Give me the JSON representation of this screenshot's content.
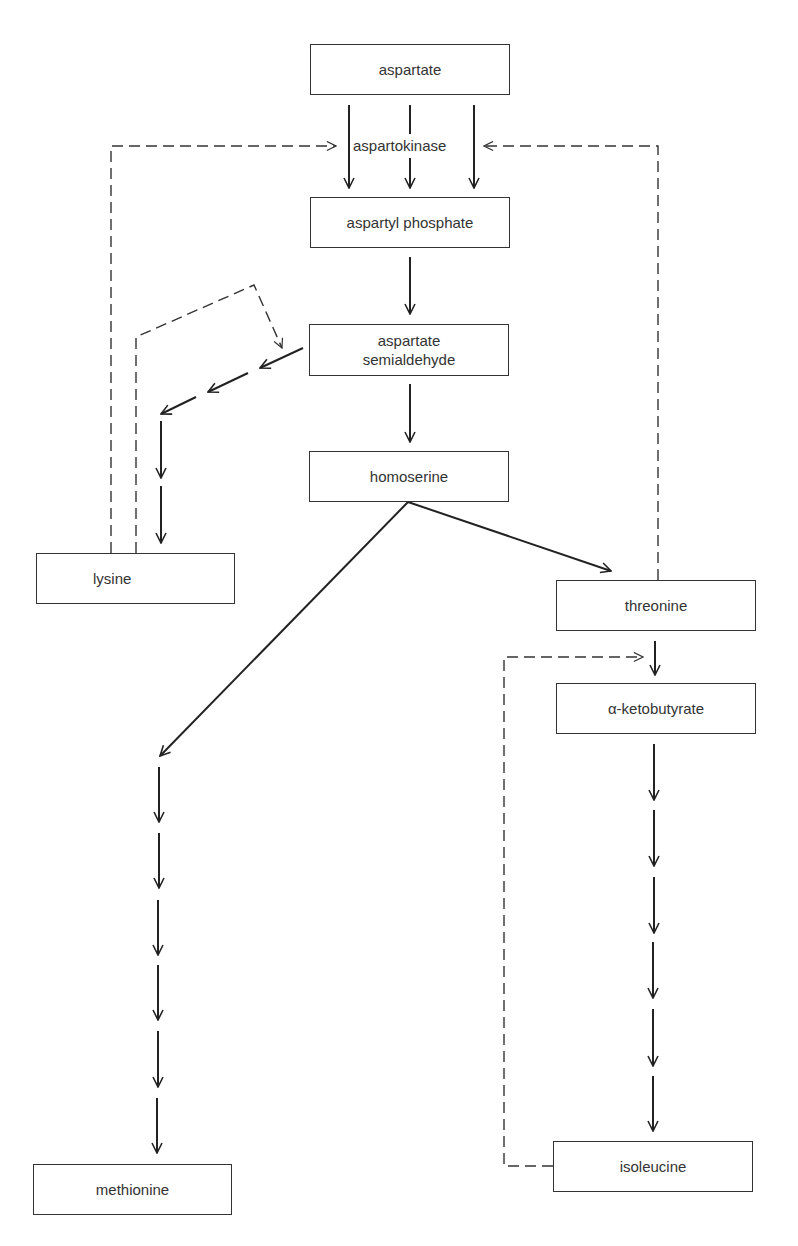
{
  "diagram": {
    "type": "metabolic-pathway",
    "nodes": {
      "aspartate": "aspartate",
      "aspartyl_phosphate": "aspartyl phosphate",
      "aspartate_semialdehyde_line1": "aspartate",
      "aspartate_semialdehyde_line2": "semialdehyde",
      "homoserine": "homoserine",
      "lysine": "lysine",
      "threonine": "threonine",
      "alpha_ketobutyrate": "α-ketobutyrate",
      "methionine": "methionine",
      "isoleucine": "isoleucine"
    },
    "enzyme_label": "aspartokinase",
    "edges": [
      {
        "from": "aspartate",
        "to": "aspartyl phosphate",
        "style": "solid",
        "count": 3,
        "via": "aspartokinase"
      },
      {
        "from": "aspartyl phosphate",
        "to": "aspartate semialdehyde",
        "style": "solid",
        "steps": 1
      },
      {
        "from": "aspartate semialdehyde",
        "to": "homoserine",
        "style": "solid",
        "steps": 1
      },
      {
        "from": "aspartate semialdehyde",
        "to": "lysine",
        "style": "solid",
        "steps": 5
      },
      {
        "from": "homoserine",
        "to": "threonine",
        "style": "solid",
        "steps": 1
      },
      {
        "from": "homoserine",
        "to": "methionine",
        "style": "solid",
        "steps": 7
      },
      {
        "from": "threonine",
        "to": "α-ketobutyrate",
        "style": "solid",
        "steps": 1
      },
      {
        "from": "α-ketobutyrate",
        "to": "isoleucine",
        "style": "solid",
        "steps": 6
      }
    ],
    "feedback": [
      {
        "from": "lysine",
        "to": "aspartokinase",
        "style": "dashed"
      },
      {
        "from": "lysine",
        "to": "aspartate semialdehyde → lysine step",
        "style": "dashed"
      },
      {
        "from": "threonine",
        "to": "aspartokinase",
        "style": "dashed"
      },
      {
        "from": "isoleucine",
        "to": "threonine → α-ketobutyrate step",
        "style": "dashed"
      }
    ]
  }
}
